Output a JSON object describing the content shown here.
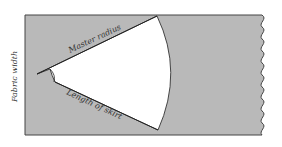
{
  "diagram": {
    "labels": {
      "fabric_width": "Fabric width",
      "master_radius": "Master radius",
      "length_of_skirt": "Length of skirt"
    },
    "colors": {
      "fabric_fill": "#b9b9b9",
      "outline": "#444444",
      "cutout_fill": "#ffffff"
    }
  }
}
